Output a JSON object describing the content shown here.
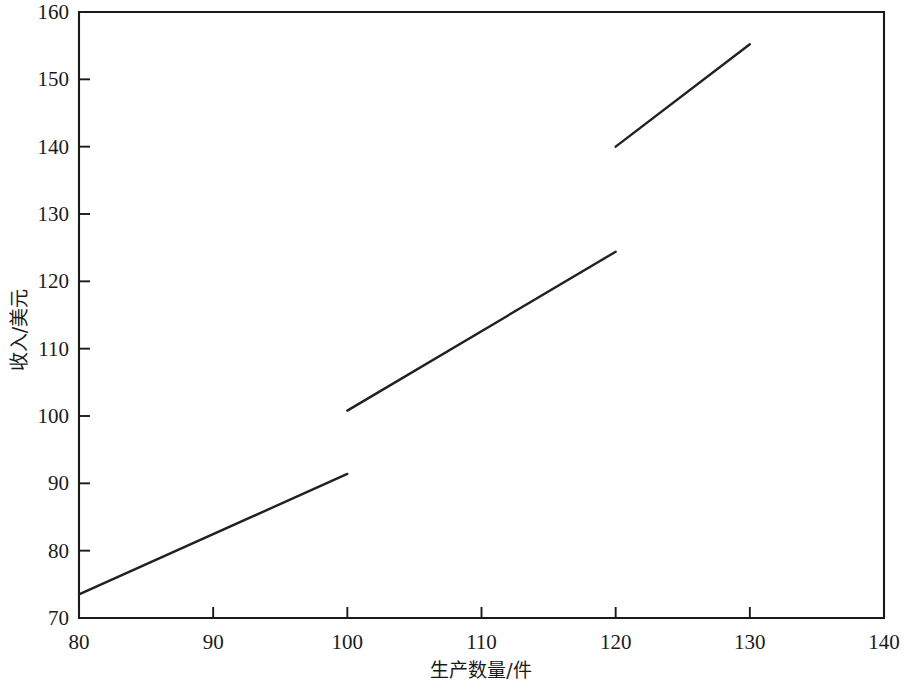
{
  "chart_data": {
    "type": "line",
    "title": "",
    "subtitle": "",
    "xlabel": "生产数量/件",
    "ylabel": "收入/美元",
    "xlim": [
      80,
      140
    ],
    "ylim": [
      70,
      160
    ],
    "xticks": [
      80,
      90,
      100,
      110,
      120,
      130,
      140
    ],
    "xtick_labels": [
      "80",
      "90",
      "100",
      "110",
      "120",
      "130",
      "140"
    ],
    "yticks": [
      70,
      80,
      90,
      100,
      110,
      120,
      130,
      140,
      150,
      160
    ],
    "ytick_labels": [
      "70",
      "80",
      "90",
      "100",
      "110",
      "120",
      "130",
      "140",
      "150",
      "160"
    ],
    "grid": false,
    "legend": null,
    "legend_position": "none",
    "annotations": [],
    "series": [
      {
        "name": "segment-1",
        "points": [
          {
            "x": 80,
            "y": 73.5
          },
          {
            "x": 100,
            "y": 91.4
          }
        ]
      },
      {
        "name": "segment-2",
        "points": [
          {
            "x": 100,
            "y": 100.8
          },
          {
            "x": 120,
            "y": 124.4
          }
        ]
      },
      {
        "name": "segment-3",
        "points": [
          {
            "x": 120,
            "y": 140.0
          },
          {
            "x": 130,
            "y": 155.2
          }
        ]
      }
    ]
  },
  "figure": {
    "background_color": "#ffffff",
    "line_color": "#23201f",
    "axis_color": "#1a1a1a"
  }
}
